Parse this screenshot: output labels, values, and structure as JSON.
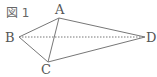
{
  "figure": {
    "caption": "図 1",
    "points": {
      "A": {
        "label": "A",
        "x": 59,
        "y": 18
      },
      "B": {
        "label": "B",
        "x": 19,
        "y": 37
      },
      "C": {
        "label": "C",
        "x": 48,
        "y": 62
      },
      "D": {
        "label": "D",
        "x": 145,
        "y": 37
      }
    },
    "solid_edges": [
      "AB",
      "AC",
      "AD",
      "BC",
      "CD"
    ],
    "dashed_edges": [
      "BD"
    ],
    "colors": {
      "line": "#777777",
      "text": "#555555"
    }
  }
}
